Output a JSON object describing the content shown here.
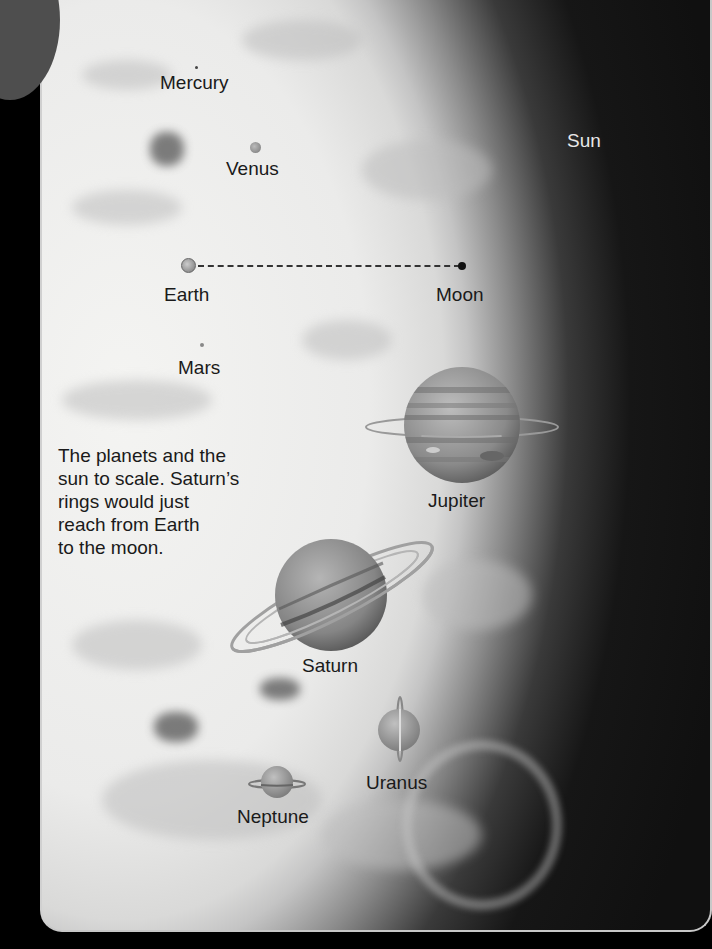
{
  "figure": {
    "caption": "The planets and the sun to scale. Saturn’s rings would just reach from Earth to the moon.",
    "caption_lines": [
      "The planets and the",
      "sun to scale. Saturn’s",
      "rings would just",
      "reach from Earth",
      "to the moon."
    ],
    "bodies": {
      "sun": "Sun",
      "mercury": "Mercury",
      "venus": "Venus",
      "earth": "Earth",
      "moon": "Moon",
      "mars": "Mars",
      "jupiter": "Jupiter",
      "saturn": "Saturn",
      "uranus": "Uranus",
      "neptune": "Neptune"
    },
    "colors": {
      "background": "#000000",
      "sun_surface": "#eeeeec",
      "label_dark": "#1a1a1a",
      "label_light": "#e8e8e8"
    }
  }
}
